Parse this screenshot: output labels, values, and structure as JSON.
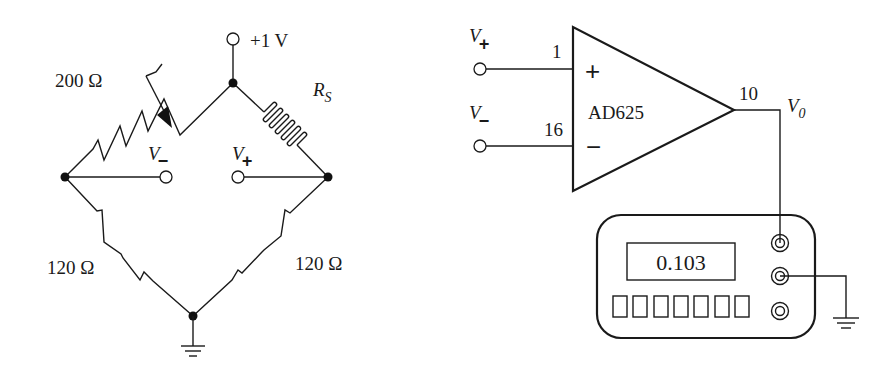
{
  "bridge": {
    "supply_label": "+1 V",
    "variable_resistor_label": "200 Ω",
    "strain_gauge_label": "R",
    "strain_gauge_subscript": "S",
    "bottom_left_resistor_label": "120 Ω",
    "bottom_right_resistor_label": "120 Ω",
    "v_minus_label": "V",
    "v_minus_sign": "−",
    "v_plus_label": "V",
    "v_plus_sign": "+"
  },
  "amplifier": {
    "name": "AD625",
    "plus_input_label": "V",
    "plus_input_sign": "+",
    "minus_input_label": "V",
    "minus_input_sign": "−",
    "pin_plus": "1",
    "pin_minus": "16",
    "pin_output": "10",
    "plus_symbol": "+",
    "minus_symbol": "−",
    "output_label": "V",
    "output_subscript": "0"
  },
  "meter": {
    "reading": "0.103",
    "button_count": 7
  }
}
